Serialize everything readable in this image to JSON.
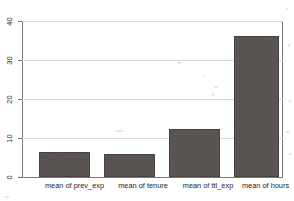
{
  "chart_data": {
    "type": "bar",
    "title": "",
    "subtitle": "",
    "xlabel": "",
    "ylabel": "",
    "categories": [
      "mean of prev_exp",
      "mean of tenure",
      "mean of ttl_exp",
      "mean of hours"
    ],
    "values": [
      6.5,
      6.0,
      12.5,
      36.5
    ],
    "ylim": [
      0,
      40
    ],
    "yticks": [
      0,
      10,
      20,
      30,
      40
    ],
    "ytick_labels": [
      "0",
      "10",
      "20",
      "30",
      "40"
    ],
    "grid": "horizontal",
    "legend": "none",
    "bar_color": "#585350",
    "gridline_color": "#d8d8d8",
    "axis_color": "#77777a",
    "background_color": "#ffffff",
    "annotations": []
  }
}
